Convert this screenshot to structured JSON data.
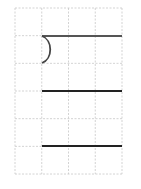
{
  "grid": {
    "x0": 15,
    "y0": 8,
    "cell_w": 26.75,
    "cell_h": 27.67,
    "cols": 4,
    "rows": 6,
    "line_color": "#c8c8c8"
  },
  "strokes": {
    "color": "#222222",
    "top_line": {
      "x1": 42,
      "y1": 36,
      "x2": 122,
      "y2": 36,
      "color": "#555555"
    },
    "arc": {
      "x_start": 42,
      "y_start": 36,
      "x_end": 42,
      "y_end": 63,
      "bulge_x": 53
    },
    "middle_line": {
      "x1": 42,
      "y1": 91,
      "x2": 122,
      "y2": 91
    },
    "bottom_line": {
      "x1": 42,
      "y1": 146,
      "x2": 122,
      "y2": 146
    }
  }
}
